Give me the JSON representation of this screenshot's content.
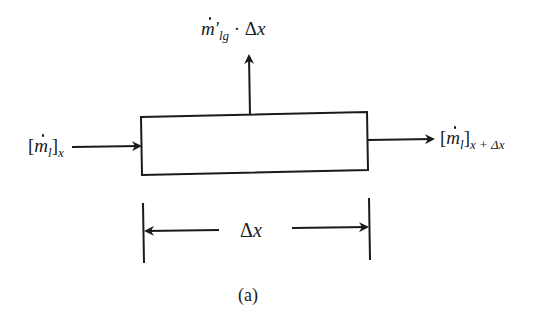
{
  "diagram": {
    "type": "control-volume flow diagram",
    "labels": {
      "top_flux": {
        "m": "m",
        "prime": "′",
        "sub": "lg",
        "op": " · Δ",
        "var": "x"
      },
      "inflow": {
        "open": "[",
        "m": "m",
        "sub_l": "l",
        "close": "]",
        "sub": "x"
      },
      "outflow": {
        "open": "[",
        "m": "m",
        "sub_l": "l",
        "close": "]",
        "sub": "x + Δx"
      },
      "length": {
        "delta": "Δ",
        "var": "x"
      },
      "caption": "(a)"
    },
    "colors": {
      "stroke": "#1a1a1a",
      "background": "#ffffff"
    }
  }
}
